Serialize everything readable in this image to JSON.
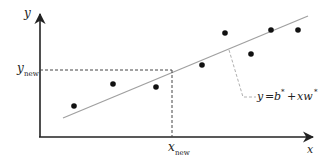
{
  "diagram": {
    "type": "linear-regression-prediction",
    "axes": {
      "x_label": "x",
      "y_label": "y"
    },
    "points": [
      {
        "x": 74,
        "y": 106
      },
      {
        "x": 113,
        "y": 84
      },
      {
        "x": 156,
        "y": 87
      },
      {
        "x": 202,
        "y": 65
      },
      {
        "x": 225,
        "y": 33
      },
      {
        "x": 251,
        "y": 54
      },
      {
        "x": 271,
        "y": 30
      },
      {
        "x": 298,
        "y": 30
      }
    ],
    "fit_line": {
      "x1": 63,
      "y1": 118,
      "x2": 308,
      "y2": 16,
      "color": "#a0a0a0"
    },
    "prediction": {
      "x_label_main": "x",
      "x_label_sub": "new",
      "y_label_main": "y",
      "y_label_sub": "new",
      "point": {
        "x": 172,
        "y": 70
      }
    },
    "equation": {
      "lhs": "y",
      "eq": "=",
      "b": "b",
      "star1": "*",
      "plus": "+",
      "xw": "xw",
      "star2": "*"
    },
    "colors": {
      "axis": "#222222",
      "point": "#111111",
      "dashed": "#444444",
      "leader": "#b0b0b0"
    }
  }
}
